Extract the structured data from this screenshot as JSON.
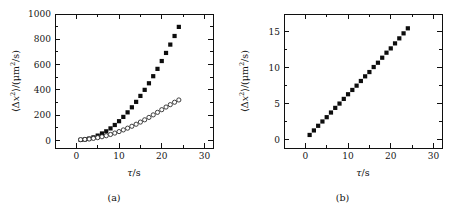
{
  "figure": {
    "background_color": "#ffffff",
    "foreground_color": "#101010",
    "panels": [
      {
        "id": "a",
        "caption": "(a)",
        "xlabel_symbol": "τ",
        "xlabel_unit": "s",
        "ylabel_text": "⟨Δx²⟩ / (μm²/s)"
      },
      {
        "id": "b",
        "caption": "(b)",
        "xlabel_symbol": "τ",
        "xlabel_unit": "s",
        "ylabel_text": "⟨Δx²⟩ / (μm²/s)"
      }
    ]
  },
  "chart_data": [
    {
      "type": "scatter",
      "panel": "a",
      "title": "",
      "xlabel": "τ/s",
      "ylabel": "⟨Δx²⟩/(μm²/s)",
      "xlim": [
        -5,
        32
      ],
      "ylim": [
        -60,
        1000
      ],
      "xticks": [
        0,
        10,
        20,
        30
      ],
      "yticks": [
        0,
        200,
        400,
        600,
        800,
        1000
      ],
      "xtick_labels": [
        "0",
        "10",
        "20",
        "30"
      ],
      "ytick_labels": [
        "0",
        "200",
        "400",
        "600",
        "800",
        "1000"
      ],
      "x_minor_interval": 5,
      "y_minor_interval": 100,
      "grid": false,
      "legend": "none",
      "series": [
        {
          "name": "filled-squares",
          "marker": "square",
          "fill": "#0d0d0d",
          "x": [
            1,
            2,
            3,
            4,
            5,
            6,
            7,
            8,
            9,
            10,
            11,
            12,
            13,
            14,
            15,
            16,
            17,
            18,
            19,
            20,
            21,
            22,
            23,
            24
          ],
          "values": [
            4,
            8,
            14,
            24,
            38,
            55,
            72,
            95,
            122,
            152,
            186,
            222,
            262,
            305,
            352,
            400,
            452,
            508,
            566,
            628,
            692,
            758,
            826,
            898
          ]
        },
        {
          "name": "open-circles",
          "marker": "circle",
          "fill": "#ffffff",
          "x": [
            1,
            2,
            3,
            4,
            5,
            6,
            7,
            8,
            9,
            10,
            11,
            12,
            13,
            14,
            15,
            16,
            17,
            18,
            19,
            20,
            21,
            22,
            23,
            24
          ],
          "values": [
            6,
            8,
            11,
            16,
            22,
            29,
            37,
            47,
            58,
            70,
            83,
            97,
            112,
            128,
            145,
            163,
            182,
            202,
            222,
            243,
            264,
            283,
            302,
            320
          ]
        }
      ]
    },
    {
      "type": "scatter",
      "panel": "b",
      "title": "",
      "xlabel": "τ/s",
      "ylabel": "⟨Δx²⟩/(μm²/s)",
      "xlim": [
        -5,
        32
      ],
      "ylim": [
        -1.2,
        17.5
      ],
      "xticks": [
        0,
        10,
        20,
        30
      ],
      "yticks": [
        0,
        5,
        10,
        15
      ],
      "xtick_labels": [
        "0",
        "10",
        "20",
        "30"
      ],
      "ytick_labels": [
        "0",
        "5",
        "10",
        "15"
      ],
      "x_minor_interval": 5,
      "y_minor_interval": 2.5,
      "grid": false,
      "legend": "none",
      "series": [
        {
          "name": "filled-squares",
          "marker": "square",
          "fill": "#0d0d0d",
          "x": [
            1,
            2,
            3,
            4,
            5,
            6,
            7,
            8,
            9,
            10,
            11,
            12,
            13,
            14,
            15,
            16,
            17,
            18,
            19,
            20,
            21,
            22,
            23,
            24
          ],
          "values": [
            0.62,
            1.25,
            1.9,
            2.5,
            3.1,
            3.75,
            4.4,
            5.0,
            5.65,
            6.3,
            6.9,
            7.5,
            8.15,
            8.8,
            9.4,
            10.1,
            10.7,
            11.4,
            12.1,
            12.7,
            13.4,
            14.1,
            14.8,
            15.5
          ]
        }
      ]
    }
  ]
}
